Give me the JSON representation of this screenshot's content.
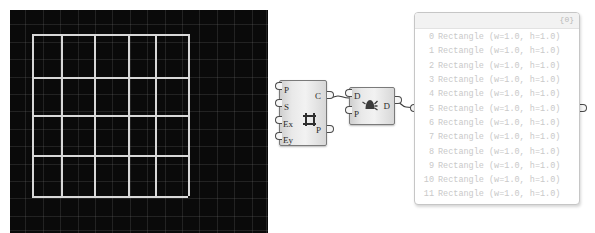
{
  "viewport": {
    "name": "rhino-3d-viewport",
    "background_color": "#0a0a0a",
    "grid_line_color": "#787878",
    "geometry_color": "#d8d8d8",
    "description": "4x3 grid of rectangles",
    "vertical_lines_x": [
      22,
      51,
      84,
      118,
      145,
      178
    ],
    "horizontal_lines_y": [
      24,
      67,
      105,
      145,
      186
    ]
  },
  "nodes": [
    {
      "id": "rectangular-grid",
      "icon": "rectangular-grid-icon",
      "inputs": [
        "P",
        "S",
        "Ex",
        "Ey"
      ],
      "outputs": [
        "C",
        "P"
      ]
    },
    {
      "id": "dispatch",
      "icon": "dispatch-icon",
      "inputs": [
        "D",
        "P"
      ],
      "outputs": [
        "D"
      ]
    }
  ],
  "panel": {
    "name": "output-panel",
    "path_label": "{0}",
    "columns": [
      "index",
      "value"
    ],
    "rows": [
      {
        "index": "0",
        "value": "Rectangle (w=1.0, h=1.0)"
      },
      {
        "index": "1",
        "value": "Rectangle (w=1.0, h=1.0)"
      },
      {
        "index": "2",
        "value": "Rectangle (w=1.0, h=1.0)"
      },
      {
        "index": "3",
        "value": "Rectangle (w=1.0, h=1.0)"
      },
      {
        "index": "4",
        "value": "Rectangle (w=1.0, h=1.0)"
      },
      {
        "index": "5",
        "value": "Rectangle (w=1.0, h=1.0)"
      },
      {
        "index": "6",
        "value": "Rectangle (w=1.0, h=1.0)"
      },
      {
        "index": "7",
        "value": "Rectangle (w=1.0, h=1.0)"
      },
      {
        "index": "8",
        "value": "Rectangle (w=1.0, h=1.0)"
      },
      {
        "index": "9",
        "value": "Rectangle (w=1.0, h=1.0)"
      },
      {
        "index": "10",
        "value": "Rectangle (w=1.0, h=1.0)"
      },
      {
        "index": "11",
        "value": "Rectangle (w=1.0, h=1.0)"
      }
    ]
  }
}
